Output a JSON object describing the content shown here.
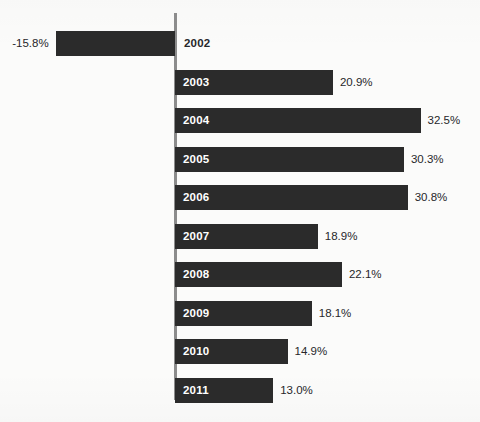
{
  "chart_data": {
    "type": "bar",
    "orientation": "horizontal",
    "title": "",
    "subtitle": "",
    "xlabel": "",
    "ylabel": "",
    "categories": [
      "2002",
      "2003",
      "2004",
      "2005",
      "2006",
      "2007",
      "2008",
      "2009",
      "2010",
      "2011"
    ],
    "values": [
      -15.8,
      20.9,
      32.5,
      30.3,
      30.8,
      18.9,
      22.1,
      18.1,
      14.9,
      13.0
    ],
    "value_labels": [
      "-15.8%",
      "20.9%",
      "32.5%",
      "30.3%",
      "30.8%",
      "18.9%",
      "22.1%",
      "18.1%",
      "14.9%",
      "13.0%"
    ],
    "xlim": [
      -15.8,
      32.5
    ],
    "grid": false,
    "legend": null,
    "bar_color": "#2b2b2b",
    "background_color": "#fbfbfa",
    "axis_color": "#8c8c8c",
    "inside_label_color": "#ffffff",
    "outside_label_color": "#27272a"
  },
  "bars": [
    {
      "year": "2002",
      "value_label": "-15.8%",
      "negative": true
    },
    {
      "year": "2003",
      "value_label": "20.9%",
      "negative": false
    },
    {
      "year": "2004",
      "value_label": "32.5%",
      "negative": false
    },
    {
      "year": "2005",
      "value_label": "30.3%",
      "negative": false
    },
    {
      "year": "2006",
      "value_label": "30.8%",
      "negative": false
    },
    {
      "year": "2007",
      "value_label": "18.9%",
      "negative": false
    },
    {
      "year": "2008",
      "value_label": "22.1%",
      "negative": false
    },
    {
      "year": "2009",
      "value_label": "18.1%",
      "negative": false
    },
    {
      "year": "2010",
      "value_label": "14.9%",
      "negative": false
    },
    {
      "year": "2011",
      "value_label": "13.0%",
      "negative": false
    }
  ]
}
